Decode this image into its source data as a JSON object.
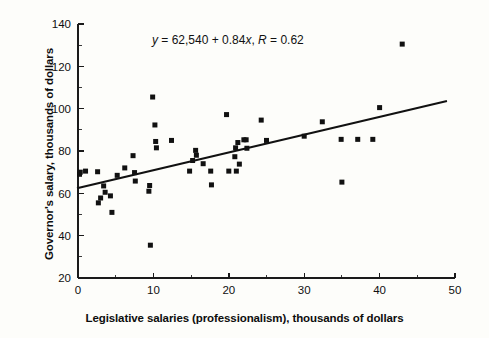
{
  "chart_data": {
    "type": "scatter",
    "title": "",
    "xlabel": "Legislative salaries (professionalism), thousands of dollars",
    "ylabel": "Governor's salary, thousands of dollars",
    "xlim": [
      0,
      50
    ],
    "ylim": [
      20,
      140
    ],
    "xticks": [
      0,
      10,
      20,
      30,
      40,
      50
    ],
    "yticks": [
      20,
      40,
      60,
      80,
      100,
      120,
      140
    ],
    "xtick_labels": [
      "0",
      "10",
      "20",
      "30",
      "40",
      "50"
    ],
    "ytick_labels": [
      "20",
      "40",
      "60",
      "80",
      "100",
      "120",
      "140"
    ],
    "x_minor_step": 5,
    "y_minor_step": 10,
    "grid": false,
    "legend": false,
    "annotation": "y = 62,540 + 0.84x, R = 0.62",
    "annotation_parts": {
      "y_symbol": "y",
      "eq1": " = 62,540 + 0.84",
      "x_symbol": "x",
      "eq2": ", ",
      "r_symbol": "R",
      "eq3": " = 0.62"
    },
    "fit": {
      "type": "linear",
      "intercept": 62.54,
      "slope": 0.84,
      "r": 0.62,
      "draw_x": [
        0,
        48.8
      ],
      "draw_y": [
        62.54,
        103.5
      ]
    },
    "marker": {
      "shape": "square",
      "color": "#111111",
      "size_px": 5
    },
    "points": [
      [
        0.2,
        69.0
      ],
      [
        0.3,
        70.0
      ],
      [
        1.0,
        70.5
      ],
      [
        2.6,
        70.2
      ],
      [
        2.7,
        55.5
      ],
      [
        3.0,
        57.8
      ],
      [
        3.4,
        63.5
      ],
      [
        3.6,
        60.5
      ],
      [
        4.3,
        58.8
      ],
      [
        4.5,
        51.0
      ],
      [
        5.2,
        68.5
      ],
      [
        6.2,
        72.0
      ],
      [
        7.3,
        77.8
      ],
      [
        7.5,
        69.8
      ],
      [
        7.6,
        65.8
      ],
      [
        9.4,
        61.0
      ],
      [
        9.5,
        63.7
      ],
      [
        9.6,
        35.5
      ],
      [
        9.9,
        105.5
      ],
      [
        10.2,
        92.3
      ],
      [
        10.3,
        84.5
      ],
      [
        10.4,
        81.5
      ],
      [
        12.4,
        85.0
      ],
      [
        14.8,
        70.5
      ],
      [
        15.2,
        75.5
      ],
      [
        15.6,
        80.3
      ],
      [
        15.7,
        78.0
      ],
      [
        16.6,
        74.0
      ],
      [
        17.6,
        70.5
      ],
      [
        17.7,
        64.0
      ],
      [
        19.7,
        97.2
      ],
      [
        20.0,
        70.5
      ],
      [
        20.8,
        77.3
      ],
      [
        20.9,
        81.5
      ],
      [
        21.0,
        70.5
      ],
      [
        21.2,
        84.0
      ],
      [
        21.4,
        73.8
      ],
      [
        22.0,
        85.3
      ],
      [
        22.3,
        85.3
      ],
      [
        22.4,
        81.3
      ],
      [
        24.3,
        94.6
      ],
      [
        25.0,
        85.0
      ],
      [
        30.0,
        87.0
      ],
      [
        32.4,
        93.8
      ],
      [
        34.9,
        85.5
      ],
      [
        35.0,
        65.3
      ],
      [
        37.1,
        85.5
      ],
      [
        39.1,
        85.5
      ],
      [
        40.0,
        100.5
      ],
      [
        43.0,
        130.5
      ]
    ]
  },
  "colors": {
    "background": "#fdfdfa",
    "ink": "#111111",
    "axis": "#1a1a1a"
  }
}
